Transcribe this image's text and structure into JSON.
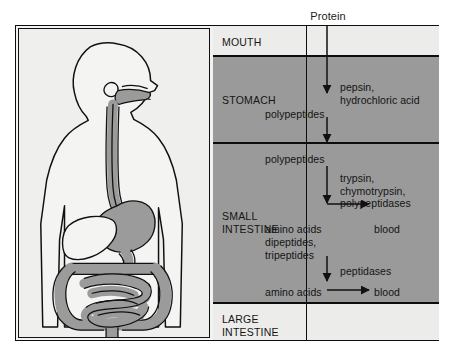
{
  "figure": {
    "title_label": "Protein",
    "colors": {
      "dark_band": "#9a9a9a",
      "light_band": "#ececeb",
      "organ_fill": "#9b9b9b",
      "body_outline": "#111111",
      "frame": "#0d0d0d",
      "page_background": "#ffffff",
      "panel_background": "#efefed"
    }
  },
  "anatomy_panel": {
    "name": "human-digestive-tract-illustration",
    "description": "Outline of a human torso and head in profile with the digestive tract shaded gray",
    "organs": [
      "mouth",
      "esophagus",
      "stomach",
      "liver",
      "small intestine",
      "large intestine"
    ]
  },
  "flowchart": {
    "rows": [
      {
        "id": "mouth",
        "organ": "MOUTH",
        "band": "light",
        "content": []
      },
      {
        "id": "stomach",
        "organ": "STOMACH",
        "band": "dark",
        "content": [
          {
            "text": "pepsin,\nhydrochloric acid",
            "role": "enzyme"
          },
          {
            "text": "polypeptides",
            "role": "product"
          }
        ]
      },
      {
        "id": "small-intestine",
        "organ": "SMALL\nINTESTINE",
        "band": "dark",
        "content": [
          {
            "text": "polypeptides",
            "role": "substrate"
          },
          {
            "text": "trypsin,\nchymotrypsin,\npolypeptidases",
            "role": "enzyme"
          },
          {
            "text": "amino acids",
            "role": "product"
          },
          {
            "text": "blood",
            "role": "destination"
          },
          {
            "text": "dipeptides,\ntripeptides",
            "role": "product"
          },
          {
            "text": "peptidases",
            "role": "enzyme"
          },
          {
            "text": "amino acids",
            "role": "product"
          },
          {
            "text": "blood",
            "role": "destination"
          }
        ]
      },
      {
        "id": "large-intestine",
        "organ": "LARGE\nINTESTINE",
        "band": "light",
        "content": []
      }
    ],
    "labels": {
      "protein": "Protein",
      "mouth": "MOUTH",
      "stomach": "STOMACH",
      "small_intestine": "SMALL\nINTESTINE",
      "large_intestine": "LARGE\nINTESTINE",
      "pepsin_hcl": "pepsin,\nhydrochloric acid",
      "polypeptides_1": "polypeptides",
      "polypeptides_2": "polypeptides",
      "trypsin_group": "trypsin,\nchymotrypsin,\npolypeptidases",
      "amino_acids_1": "amino acids",
      "blood_1": "blood",
      "di_tripeptides": "dipeptides,\ntripeptides",
      "peptidases": "peptidases",
      "amino_acids_2": "amino acids",
      "blood_2": "blood"
    }
  }
}
